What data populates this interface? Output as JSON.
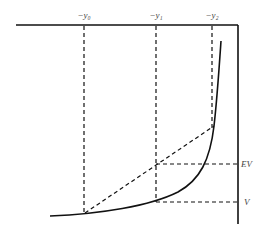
{
  "diagram": {
    "top_labels": [
      {
        "id": "y0",
        "text": "−y₀",
        "x": 84
      },
      {
        "id": "y1",
        "text": "−y₁",
        "x": 156
      },
      {
        "id": "y2",
        "text": "−y₂",
        "x": 212
      }
    ],
    "right_labels": [
      {
        "id": "ev",
        "text": "EV",
        "y": 164
      },
      {
        "id": "v",
        "text": "V",
        "y": 202
      }
    ],
    "colors": {
      "line": "#111111",
      "label": "#444444",
      "background": "#ffffff"
    }
  }
}
